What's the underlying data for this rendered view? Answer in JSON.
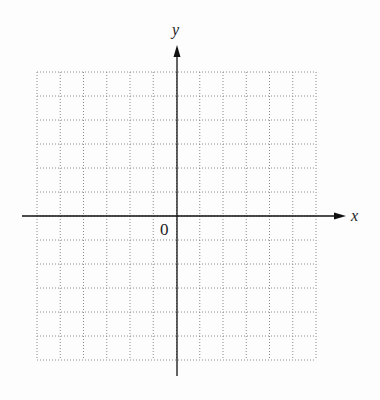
{
  "diagram": {
    "type": "blank coordinate grid",
    "axes": {
      "x_label": "x",
      "y_label": "y",
      "origin_label": "0"
    },
    "grid": {
      "columns": 12,
      "rows": 12,
      "style": "dotted",
      "line_color": "#888888",
      "axis_color": "#111111"
    }
  }
}
